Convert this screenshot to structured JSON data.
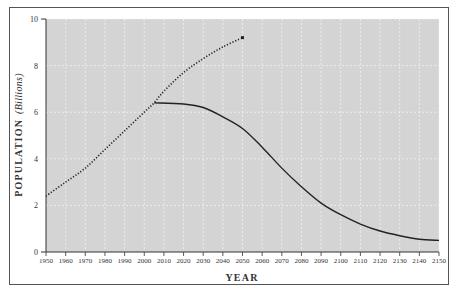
{
  "chart_data": {
    "type": "line",
    "title": "",
    "xlabel": "YEAR",
    "ylabel": "POPULATION",
    "ylabel_unit": "(Billions)",
    "xlim": [
      1950,
      2150
    ],
    "ylim": [
      0,
      10
    ],
    "x_ticks": [
      1950,
      1960,
      1970,
      1980,
      1990,
      2000,
      2010,
      2020,
      2030,
      2040,
      2050,
      2060,
      2070,
      2080,
      2090,
      2100,
      2110,
      2120,
      2130,
      2140,
      2150
    ],
    "y_ticks": [
      0,
      2,
      4,
      6,
      8,
      10
    ],
    "grid": true,
    "legend": null,
    "series": [
      {
        "name": "Projected growth (dotted)",
        "style": "dotted",
        "x": [
          1950,
          1960,
          1970,
          1980,
          1990,
          2000,
          2005,
          2010,
          2020,
          2030,
          2040,
          2050
        ],
        "values": [
          2.4,
          3.0,
          3.6,
          4.4,
          5.2,
          6.0,
          6.4,
          6.9,
          7.7,
          8.3,
          8.8,
          9.2
        ]
      },
      {
        "name": "Projected decline (solid)",
        "style": "solid",
        "x": [
          2005,
          2020,
          2030,
          2040,
          2050,
          2060,
          2070,
          2080,
          2090,
          2100,
          2110,
          2120,
          2130,
          2140,
          2150
        ],
        "values": [
          6.4,
          6.35,
          6.2,
          5.8,
          5.3,
          4.5,
          3.6,
          2.8,
          2.1,
          1.6,
          1.2,
          0.9,
          0.7,
          0.55,
          0.5
        ]
      }
    ]
  },
  "colors": {
    "plot_background": "#d4d4d4",
    "grid": "#f2f2f2",
    "line": "#222222",
    "frame": "#555555"
  }
}
